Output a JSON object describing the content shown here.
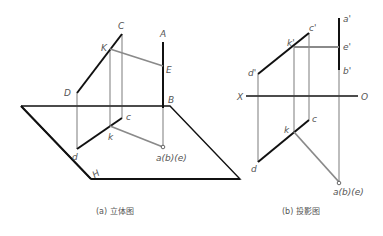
{
  "figure_a": {
    "caption": "(a) 立体图",
    "labels": {
      "A": "A",
      "B": "B",
      "C": "C",
      "D": "D",
      "E": "E",
      "K": "K",
      "c": "c",
      "d": "d",
      "k": "k",
      "abe": "a(b)(e)",
      "H": "H"
    }
  },
  "figure_b": {
    "caption": "(b) 投影图",
    "labels": {
      "a_prime": "a'",
      "e_prime": "e'",
      "b_prime": "b'",
      "c_prime": "c'",
      "k_prime": "k'",
      "d_prime": "d'",
      "X": "X",
      "O": "O",
      "c": "c",
      "k": "k",
      "d": "d",
      "abe": "a(b)(e)"
    }
  },
  "colors": {
    "thick_line": "#111111",
    "thin_line": "#444444",
    "gray_line": "#8a8a8a",
    "label": "#555555"
  }
}
